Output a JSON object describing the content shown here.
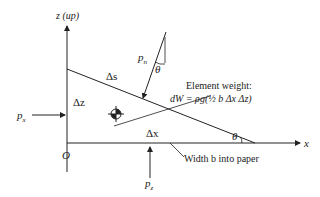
{
  "diagram": {
    "axes": {
      "z_label": "z (up)",
      "x_label": "x",
      "origin_label": "O"
    },
    "element": {
      "side_vertical": "Δz",
      "side_horizontal": "Δx",
      "side_hypotenuse": "Δs",
      "angle_label": "θ"
    },
    "pressures": {
      "px_base": "p",
      "px_sub": "x",
      "pz_base": "p",
      "pz_sub": "z",
      "pn_base": "p",
      "pn_sub": "n",
      "pn_angle": "θ"
    },
    "weight": {
      "title": "Element weight:",
      "formula": "dW = ρg(½ b Δx Δz)"
    },
    "width_note": "Width b into paper",
    "colors": {
      "line": "#222222",
      "background": "#ffffff"
    }
  }
}
